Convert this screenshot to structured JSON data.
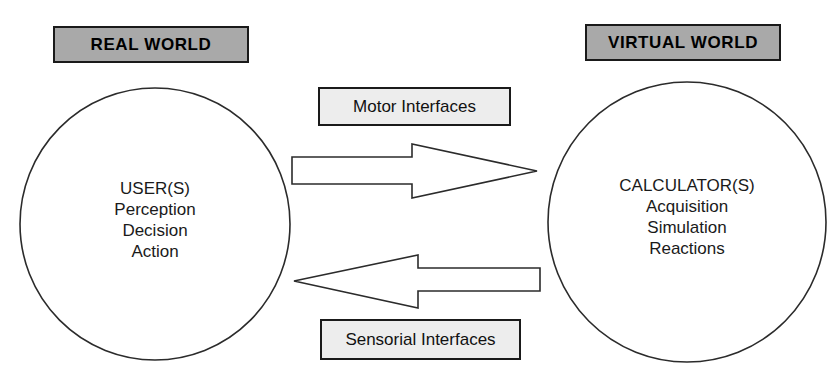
{
  "diagram": {
    "background_color": "#ffffff",
    "header_fill": "#a9a9a9",
    "label_fill": "#ededed",
    "stroke_color": "#1a1a1a",
    "headers": [
      {
        "id": "real-world",
        "label": "REAL WORLD"
      },
      {
        "id": "virtual-world",
        "label": "VIRTUAL WORLD"
      }
    ],
    "nodes": [
      {
        "id": "user",
        "title": "USER(S)",
        "lines": [
          "Perception",
          "Decision",
          "Action"
        ]
      },
      {
        "id": "calculator",
        "title": "CALCULATOR(S)",
        "lines": [
          "Acquisition",
          "Simulation",
          "Reactions"
        ]
      }
    ],
    "connectors": [
      {
        "id": "motor",
        "label": "Motor Interfaces",
        "direction": "right",
        "from": "user",
        "to": "calculator"
      },
      {
        "id": "sensorial",
        "label": "Sensorial Interfaces",
        "direction": "left",
        "from": "calculator",
        "to": "user"
      }
    ]
  }
}
